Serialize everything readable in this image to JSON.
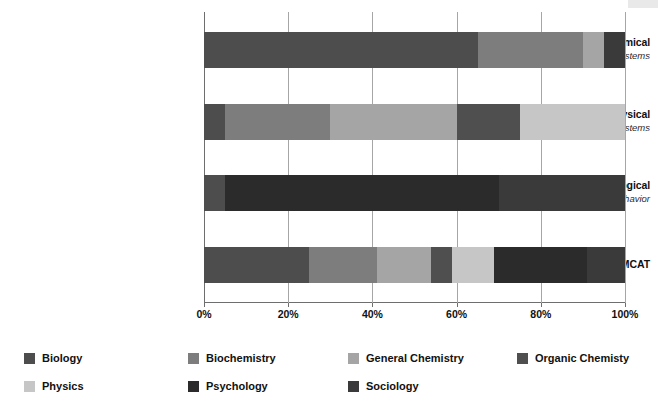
{
  "chart_data": {
    "type": "bar",
    "subtype": "100% stacked horizontal bar",
    "title": "",
    "xlabel": "",
    "ylabel": "",
    "xlim": [
      0,
      100
    ],
    "xticks": [
      0,
      20,
      40,
      60,
      80,
      100
    ],
    "xtick_labels": [
      "0%",
      "20%",
      "40%",
      "60%",
      "80%",
      "100%"
    ],
    "grid": true,
    "legend_position": "bottom",
    "categories": [
      {
        "main": "Biological and Biochemical",
        "sub": "Foundations of Living Systems"
      },
      {
        "main": "Chemical and Physical",
        "sub": "Foundations of Biological Systems"
      },
      {
        "main": "Psychological, Social, and Biological",
        "sub": "Foundations of Behavior"
      },
      {
        "main": "MCAT",
        "sub": ""
      }
    ],
    "series": [
      {
        "name": "Biology",
        "color": "#4d4d4d",
        "values": [
          65,
          5,
          5,
          25
        ]
      },
      {
        "name": "Biochemistry",
        "color": "#7d7d7d",
        "values": [
          25,
          25,
          0,
          16
        ]
      },
      {
        "name": "General Chemistry",
        "color": "#a5a5a5",
        "values": [
          0,
          30,
          0,
          13
        ]
      },
      {
        "name": "Organic Chemisty",
        "color": "#4f4f4f",
        "values": [
          0,
          15,
          0,
          5
        ]
      },
      {
        "name": "Physics",
        "color": "#c6c6c6",
        "values": [
          0,
          25,
          0,
          10
        ]
      },
      {
        "name": "Psychology",
        "color": "#2b2b2b",
        "values": [
          0,
          0,
          65,
          22
        ]
      },
      {
        "name": "Sociology",
        "color": "#3a3a3a",
        "values": [
          10,
          0,
          30,
          9
        ]
      }
    ],
    "stacks": [
      {
        "category": "Biological and Biochemical",
        "segments": [
          {
            "name": "Biology",
            "value": 65,
            "color": "#4d4d4d"
          },
          {
            "name": "Biochemistry",
            "value": 25,
            "color": "#7d7d7d"
          },
          {
            "name": "Physics",
            "value": 5,
            "color": "#a5a5a5"
          },
          {
            "name": "Sociology",
            "value": 5,
            "color": "#3a3a3a"
          }
        ]
      },
      {
        "category": "Chemical and Physical",
        "segments": [
          {
            "name": "Biology",
            "value": 5,
            "color": "#4d4d4d"
          },
          {
            "name": "Biochemistry",
            "value": 25,
            "color": "#7d7d7d"
          },
          {
            "name": "General Chemistry",
            "value": 30,
            "color": "#a5a5a5"
          },
          {
            "name": "Organic Chemisty",
            "value": 15,
            "color": "#4f4f4f"
          },
          {
            "name": "Physics",
            "value": 25,
            "color": "#c6c6c6"
          }
        ]
      },
      {
        "category": "Psychological, Social, and Biological",
        "segments": [
          {
            "name": "Biology",
            "value": 5,
            "color": "#4d4d4d"
          },
          {
            "name": "Psychology",
            "value": 65,
            "color": "#2b2b2b"
          },
          {
            "name": "Sociology",
            "value": 30,
            "color": "#3a3a3a"
          }
        ]
      },
      {
        "category": "MCAT",
        "segments": [
          {
            "name": "Biology",
            "value": 25,
            "color": "#4d4d4d"
          },
          {
            "name": "Biochemistry",
            "value": 16,
            "color": "#7d7d7d"
          },
          {
            "name": "General Chemistry",
            "value": 13,
            "color": "#a5a5a5"
          },
          {
            "name": "Organic Chemisty",
            "value": 5,
            "color": "#4f4f4f"
          },
          {
            "name": "Physics",
            "value": 10,
            "color": "#c6c6c6"
          },
          {
            "name": "Psychology",
            "value": 22,
            "color": "#2b2b2b"
          },
          {
            "name": "Sociology",
            "value": 9,
            "color": "#3a3a3a"
          }
        ]
      }
    ],
    "legend": [
      {
        "label": "Biology",
        "color": "#4d4d4d"
      },
      {
        "label": "Biochemistry",
        "color": "#7d7d7d"
      },
      {
        "label": "General Chemistry",
        "color": "#a5a5a5"
      },
      {
        "label": "Organic Chemisty",
        "color": "#4f4f4f"
      },
      {
        "label": "Physics",
        "color": "#c6c6c6"
      },
      {
        "label": "Psychology",
        "color": "#2b2b2b"
      },
      {
        "label": "Sociology",
        "color": "#3a3a3a"
      }
    ]
  }
}
